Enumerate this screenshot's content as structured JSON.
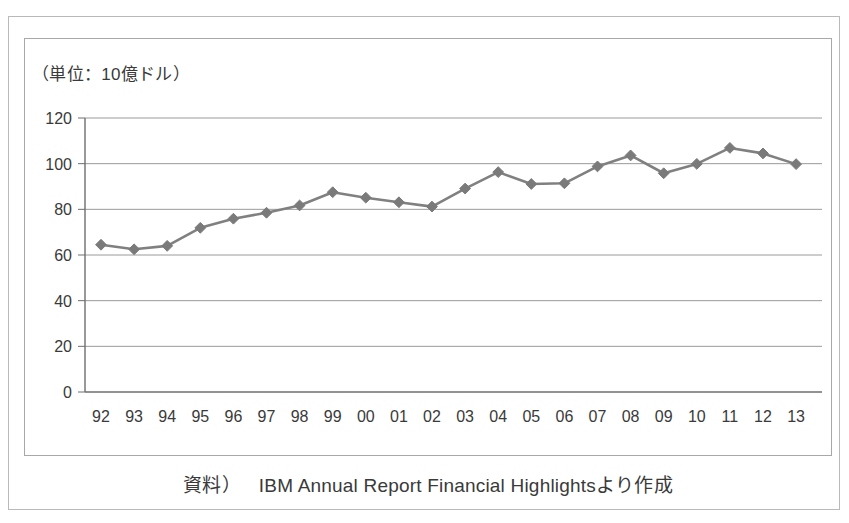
{
  "figure": {
    "unit_label": "（単位：10億ドル）",
    "caption_source_label": "資料）",
    "caption_text": "IBM Annual Report Financial Highlightsより作成"
  },
  "colors": {
    "series_line": "#808080",
    "marker": "#7a7a7a",
    "axis": "#6e6e6e",
    "gridline": "#9a9a9a",
    "text": "#3a3a3a",
    "frame_outer": "#b9b9b9",
    "frame_inner": "#a8a8a8",
    "background": "#ffffff"
  },
  "chart_data": {
    "type": "line",
    "title": "",
    "subtitle": "",
    "xlabel": "",
    "ylabel": "（単位：10億ドル）",
    "x": [
      "92",
      "93",
      "94",
      "95",
      "96",
      "97",
      "98",
      "99",
      "00",
      "01",
      "02",
      "03",
      "04",
      "05",
      "06",
      "07",
      "08",
      "09",
      "10",
      "11",
      "12",
      "13"
    ],
    "categories": [
      "92",
      "93",
      "94",
      "95",
      "96",
      "97",
      "98",
      "99",
      "00",
      "01",
      "02",
      "03",
      "04",
      "05",
      "06",
      "07",
      "08",
      "09",
      "10",
      "11",
      "12",
      "13"
    ],
    "values": [
      64.5,
      62.5,
      64.0,
      71.9,
      75.9,
      78.5,
      81.7,
      87.5,
      85.1,
      83.1,
      81.2,
      89.1,
      96.3,
      91.1,
      91.4,
      98.8,
      103.6,
      95.8,
      99.9,
      106.9,
      104.5,
      99.8
    ],
    "series": [
      {
        "name": "IBM 売上高",
        "values": [
          64.5,
          62.5,
          64.0,
          71.9,
          75.9,
          78.5,
          81.7,
          87.5,
          85.1,
          83.1,
          81.2,
          89.1,
          96.3,
          91.1,
          91.4,
          98.8,
          103.6,
          95.8,
          99.9,
          106.9,
          104.5,
          99.8
        ]
      }
    ],
    "ylim": [
      0,
      120
    ],
    "yticks": [
      0,
      20,
      40,
      60,
      80,
      100,
      120
    ],
    "ytick_labels": [
      "0",
      "20",
      "40",
      "60",
      "80",
      "100",
      "120"
    ],
    "grid": true,
    "grid_axis": "y",
    "legend": false,
    "legend_position": "none",
    "marker": "diamond",
    "annotations": []
  }
}
